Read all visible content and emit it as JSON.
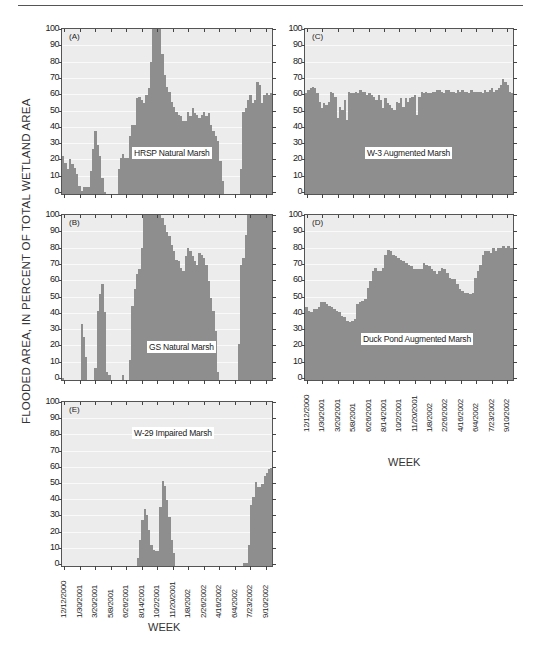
{
  "figure": {
    "ylabel": "FLOODED AREA, IN PERCENT OF TOTAL WETLAND AREA",
    "xlabel": "WEEK",
    "yticks": [
      "0",
      "10",
      "20",
      "30",
      "40",
      "50",
      "60",
      "70",
      "80",
      "90",
      "100"
    ],
    "xticks": [
      "12/12/2000",
      "1/30/2001",
      "3/20/2001",
      "5/8/2001",
      "6/26/2001",
      "8/14/2001",
      "10/2/2001",
      "11/20/2001",
      "1/8/2002",
      "2/26/2002",
      "4/16/2002",
      "6/4/2002",
      "7/23/2002",
      "9/10/2002"
    ],
    "colors": {
      "bar": "#8e8e8e",
      "background": "#ececec",
      "grid": "#fafafa",
      "frame": "#555555"
    }
  },
  "chart_data": [
    {
      "type": "bar",
      "panel": "(A)",
      "title": "HRSP Natural Marsh",
      "xlabel": "WEEK",
      "ylabel": "FLOODED AREA, IN PERCENT OF TOTAL WETLAND AREA",
      "ylim": [
        0,
        100
      ],
      "grid": true,
      "x_range": [
        "12/12/2000",
        "9/10/2002+"
      ],
      "values": [
        23,
        19,
        15,
        21,
        18,
        16,
        12,
        5,
        2,
        4,
        4,
        4,
        14,
        27,
        38,
        30,
        23,
        10,
        1,
        0,
        0,
        0,
        0,
        0,
        15,
        22,
        24,
        22,
        22,
        35,
        42,
        42,
        58,
        59,
        57,
        55,
        60,
        64,
        80,
        100,
        100,
        100,
        100,
        85,
        72,
        65,
        62,
        56,
        53,
        50,
        48,
        47,
        44,
        44,
        50,
        47,
        52,
        49,
        48,
        46,
        48,
        50,
        47,
        49,
        42,
        38,
        35,
        32,
        20,
        8,
        0,
        0,
        0,
        0,
        0,
        0,
        0,
        15,
        50,
        52,
        57,
        60,
        55,
        57,
        68,
        66,
        55,
        60,
        61,
        60,
        61
      ]
    },
    {
      "type": "bar",
      "panel": "(B)",
      "title": "GS Natural Marsh",
      "xlabel": "WEEK",
      "ylabel": "FLOODED AREA, IN PERCENT OF TOTAL WETLAND AREA",
      "ylim": [
        0,
        100
      ],
      "grid": true,
      "values": [
        1,
        0,
        0,
        0,
        0,
        0,
        0,
        0,
        34,
        26,
        14,
        0,
        0,
        0,
        7,
        42,
        52,
        58,
        41,
        5,
        3,
        0,
        0,
        0,
        0,
        0,
        3,
        0,
        0,
        12,
        45,
        55,
        64,
        67,
        80,
        100,
        100,
        100,
        100,
        100,
        100,
        100,
        100,
        98,
        94,
        90,
        87,
        82,
        78,
        73,
        72,
        68,
        66,
        75,
        80,
        78,
        75,
        72,
        70,
        77,
        76,
        74,
        70,
        60,
        50,
        42,
        30,
        5,
        0,
        0,
        0,
        0,
        0,
        0,
        0,
        0,
        22,
        70,
        74,
        88,
        100,
        100,
        100,
        100,
        100,
        100,
        100,
        100,
        100,
        100,
        100
      ]
    },
    {
      "type": "bar",
      "panel": "(C)",
      "title": "W-3 Augmented Marsh",
      "xlabel": "WEEK",
      "ylabel": "FLOODED AREA, IN PERCENT OF TOTAL WETLAND AREA",
      "ylim": [
        0,
        100
      ],
      "grid": true,
      "values": [
        61,
        63,
        64,
        65,
        64,
        61,
        56,
        52,
        55,
        54,
        56,
        62,
        61,
        59,
        46,
        53,
        51,
        57,
        45,
        62,
        61,
        61,
        62,
        61,
        63,
        62,
        62,
        60,
        61,
        60,
        59,
        57,
        60,
        57,
        52,
        58,
        55,
        54,
        52,
        51,
        56,
        55,
        58,
        53,
        58,
        56,
        58,
        59,
        60,
        48,
        59,
        62,
        61,
        62,
        61,
        61,
        62,
        62,
        63,
        63,
        62,
        61,
        63,
        63,
        62,
        62,
        61,
        63,
        62,
        63,
        62,
        62,
        61,
        63,
        62,
        62,
        62,
        62,
        61,
        63,
        62,
        63,
        64,
        62,
        63,
        64,
        66,
        70,
        68,
        66,
        62,
        61
      ]
    },
    {
      "type": "bar",
      "panel": "(D)",
      "title": "Duck Pond Augmented Marsh",
      "xlabel": "WEEK",
      "ylabel": "FLOODED AREA, IN PERCENT OF TOTAL WETLAND AREA",
      "ylim": [
        0,
        100
      ],
      "grid": true,
      "values": [
        44,
        42,
        41,
        43,
        43,
        44,
        47,
        47,
        46,
        45,
        44,
        43,
        42,
        41,
        39,
        38,
        36,
        35,
        36,
        37,
        46,
        47,
        48,
        49,
        56,
        60,
        66,
        68,
        66,
        66,
        68,
        76,
        79,
        78,
        76,
        75,
        74,
        73,
        72,
        71,
        70,
        69,
        67,
        67,
        67,
        67,
        71,
        70,
        69,
        67,
        66,
        64,
        66,
        68,
        67,
        65,
        62,
        61,
        61,
        58,
        55,
        54,
        53,
        53,
        52,
        53,
        62,
        66,
        70,
        76,
        78,
        78,
        77,
        80,
        78,
        80,
        80,
        81,
        80,
        81,
        80
      ]
    },
    {
      "type": "bar",
      "panel": "(E)",
      "title": "W-29 Impaired Marsh",
      "xlabel": "WEEK",
      "ylabel": "FLOODED AREA, IN PERCENT OF TOTAL WETLAND AREA",
      "ylim": [
        0,
        100
      ],
      "grid": true,
      "values": [
        0,
        0,
        0,
        0,
        0,
        0,
        0,
        0,
        0,
        0,
        0,
        0,
        0,
        0,
        0,
        0,
        0,
        0,
        0,
        0,
        0,
        0,
        0,
        0,
        0,
        0,
        0,
        0,
        0,
        0,
        0,
        0,
        0,
        5,
        16,
        28,
        35,
        31,
        22,
        13,
        10,
        9,
        9,
        36,
        52,
        49,
        40,
        30,
        16,
        8,
        0,
        0,
        0,
        0,
        0,
        0,
        0,
        0,
        0,
        0,
        0,
        0,
        0,
        0,
        0,
        0,
        0,
        0,
        0,
        0,
        0,
        0,
        0,
        0,
        0,
        0,
        0,
        0,
        0,
        0,
        2,
        2,
        13,
        37,
        42,
        51,
        48,
        48,
        50,
        55,
        57,
        59,
        60
      ]
    }
  ]
}
